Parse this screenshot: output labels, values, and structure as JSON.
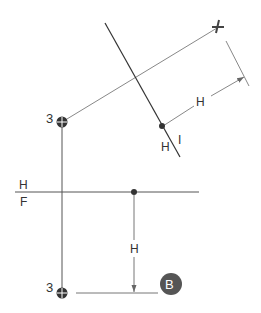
{
  "diagram": {
    "title": "",
    "labels": {
      "point_top": "3",
      "point_bottom": "3",
      "dim_aux": "H",
      "line_h": "H",
      "line_i": "I",
      "fold_upper": "H",
      "fold_lower": "F",
      "dim_front": "H",
      "badge": "B"
    },
    "colors": {
      "line": "#444444",
      "thin": "#777777",
      "badge_fill": "#555555",
      "badge_text": "#ffffff"
    }
  }
}
